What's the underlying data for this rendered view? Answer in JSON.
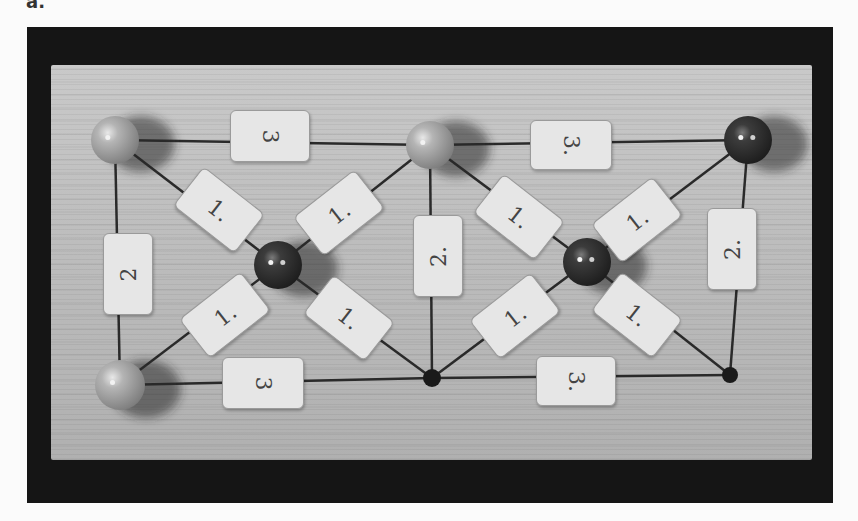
{
  "panel_label": "a.",
  "scene": {
    "description": "Photograph of a wooden board with a drawn graph: colored balls at vertices and numbered paper cards on edges",
    "colors": {
      "frame": "#151515",
      "board": "#bdbdbd",
      "light_ball": "#a9a9a9",
      "dark_ball": "#3a3a3a",
      "card": "#e6e6e6",
      "line": "#2a2a2a"
    }
  },
  "nodes": [
    {
      "id": "top-left",
      "type": "light-ball",
      "x": 115,
      "y": 140,
      "r": 24
    },
    {
      "id": "top-middle",
      "type": "light-ball",
      "x": 430,
      "y": 145,
      "r": 24
    },
    {
      "id": "top-right",
      "type": "dark-ball",
      "x": 748,
      "y": 140,
      "r": 24
    },
    {
      "id": "center-left",
      "type": "dark-ball",
      "x": 278,
      "y": 265,
      "r": 24
    },
    {
      "id": "center-right",
      "type": "dark-ball",
      "x": 587,
      "y": 262,
      "r": 24
    },
    {
      "id": "bottom-left",
      "type": "light-ball",
      "x": 120,
      "y": 385,
      "r": 25
    },
    {
      "id": "bottom-middle",
      "type": "small-dot",
      "x": 432,
      "y": 378,
      "r": 9
    },
    {
      "id": "bottom-right",
      "type": "small-dot",
      "x": 730,
      "y": 375,
      "r": 8
    }
  ],
  "edges": [
    {
      "from": "top-left",
      "to": "top-middle",
      "label": "3"
    },
    {
      "from": "top-middle",
      "to": "top-right",
      "label": "3."
    },
    {
      "from": "bottom-left",
      "to": "bottom-middle",
      "label": "3"
    },
    {
      "from": "bottom-middle",
      "to": "bottom-right",
      "label": "3."
    },
    {
      "from": "top-left",
      "to": "bottom-left",
      "label": "2"
    },
    {
      "from": "top-middle",
      "to": "bottom-middle",
      "label": "2."
    },
    {
      "from": "top-right",
      "to": "bottom-right",
      "label": "2."
    },
    {
      "from": "top-left",
      "to": "center-left",
      "label": "1."
    },
    {
      "from": "top-middle",
      "to": "center-left",
      "label": "1."
    },
    {
      "from": "bottom-left",
      "to": "center-left",
      "label": "1."
    },
    {
      "from": "bottom-middle",
      "to": "center-left",
      "label": "1."
    },
    {
      "from": "top-middle",
      "to": "center-right",
      "label": "1."
    },
    {
      "from": "top-right",
      "to": "center-right",
      "label": "1."
    },
    {
      "from": "bottom-middle",
      "to": "center-right",
      "label": "1."
    },
    {
      "from": "bottom-right",
      "to": "center-right",
      "label": "1."
    }
  ],
  "cards": [
    {
      "id": "card-top-left-3",
      "text": "3",
      "x": 230,
      "y": 110,
      "w": 78,
      "h": 50,
      "rot": 0,
      "textrot": 90
    },
    {
      "id": "card-top-right-3",
      "text": "3.",
      "x": 530,
      "y": 120,
      "w": 80,
      "h": 48,
      "rot": 0,
      "textrot": 90
    },
    {
      "id": "card-bottom-left-3",
      "text": "3",
      "x": 222,
      "y": 357,
      "w": 80,
      "h": 50,
      "rot": 0,
      "textrot": 90
    },
    {
      "id": "card-bottom-right-3",
      "text": "3.",
      "x": 536,
      "y": 356,
      "w": 78,
      "h": 48,
      "rot": 0,
      "textrot": 90
    },
    {
      "id": "card-left-2",
      "text": "2",
      "x": 103,
      "y": 233,
      "w": 48,
      "h": 80,
      "rot": 0,
      "textrot": -90
    },
    {
      "id": "card-middle-2",
      "text": "2.",
      "x": 413,
      "y": 215,
      "w": 48,
      "h": 80,
      "rot": 0,
      "textrot": -90
    },
    {
      "id": "card-right-2",
      "text": "2.",
      "x": 707,
      "y": 208,
      "w": 48,
      "h": 80,
      "rot": 0,
      "textrot": -90
    },
    {
      "id": "card-tl-diag-1",
      "text": "1.",
      "x": 180,
      "y": 185,
      "w": 76,
      "h": 48,
      "rot": 38,
      "textrot": 0
    },
    {
      "id": "card-tm-left-diag-1",
      "text": "1.",
      "x": 300,
      "y": 188,
      "w": 76,
      "h": 48,
      "rot": -38,
      "textrot": 0
    },
    {
      "id": "card-bl-diag-1",
      "text": "1.",
      "x": 186,
      "y": 290,
      "w": 76,
      "h": 48,
      "rot": -38,
      "textrot": 0
    },
    {
      "id": "card-bm-left-diag-1",
      "text": "1.",
      "x": 310,
      "y": 293,
      "w": 76,
      "h": 48,
      "rot": 38,
      "textrot": 0
    },
    {
      "id": "card-tm-right-diag-1",
      "text": "1.",
      "x": 480,
      "y": 192,
      "w": 76,
      "h": 48,
      "rot": 38,
      "textrot": 0
    },
    {
      "id": "card-tr-diag-1",
      "text": "1.",
      "x": 598,
      "y": 195,
      "w": 76,
      "h": 48,
      "rot": -38,
      "textrot": 0
    },
    {
      "id": "card-bm-right-diag-1",
      "text": "1.",
      "x": 476,
      "y": 291,
      "w": 76,
      "h": 48,
      "rot": -38,
      "textrot": 0
    },
    {
      "id": "card-br-diag-1",
      "text": "1.",
      "x": 598,
      "y": 290,
      "w": 76,
      "h": 48,
      "rot": 38,
      "textrot": 0
    }
  ]
}
